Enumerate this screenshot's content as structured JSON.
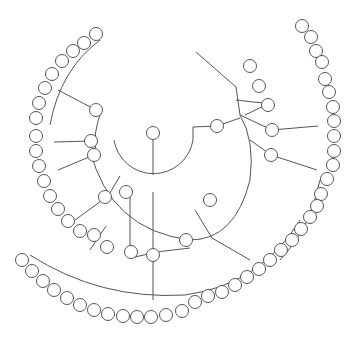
{
  "diagram": {
    "type": "radial-tree",
    "background": "#ffffff",
    "stroke_color": "#555555",
    "node_radius": 6.5,
    "root": {
      "x": 153,
      "y": 133
    },
    "arcs": [
      {
        "name": "inner-arc",
        "d": "M 114 140 A 40 40 0 0 0 193 140 L 193 127"
      },
      {
        "name": "mid-arc",
        "d": "M 102 110 A 80 80 0 0 0 96 155"
      },
      {
        "name": "main-arc",
        "d": "M 90 150 Q 110 230 190 240 Q 235 240 250 180 Q 255 140 240 115"
      },
      {
        "name": "lower-arc",
        "d": "M 130 258 Q 160 250 190 248"
      },
      {
        "name": "outer-bottom-arc",
        "d": "M 30 255 Q 100 300 185 295 Q 260 285 300 220"
      },
      {
        "name": "outer-topleft-arc",
        "d": "M 100 40 Q 60 70 50 125"
      },
      {
        "name": "outer-right-arc",
        "d": "M 320 180 Q 310 230 280 260"
      }
    ],
    "edges": [
      [
        153,
        133,
        153,
        175
      ],
      [
        193,
        127,
        217,
        126
      ],
      [
        240,
        118,
        217,
        126
      ],
      [
        240,
        115,
        272,
        130
      ],
      [
        240,
        115,
        236,
        87
      ],
      [
        236,
        87,
        212,
        66
      ],
      [
        212,
        66,
        196,
        52
      ],
      [
        236,
        100,
        253,
        102
      ],
      [
        253,
        102,
        265,
        103
      ],
      [
        245,
        115,
        270,
        103
      ],
      [
        250,
        140,
        271,
        155
      ],
      [
        271,
        155,
        317,
        170
      ],
      [
        272,
        130,
        318,
        126
      ],
      [
        195,
        210,
        212,
        238
      ],
      [
        212,
        238,
        250,
        260
      ],
      [
        153,
        192,
        153,
        300
      ],
      [
        130,
        190,
        130,
        258
      ],
      [
        96,
        110,
        58,
        90
      ],
      [
        91,
        141,
        54,
        142
      ],
      [
        94,
        155,
        58,
        170
      ],
      [
        108,
        196,
        75,
        220
      ],
      [
        108,
        196,
        120,
        176
      ],
      [
        106,
        226,
        90,
        250
      ]
    ],
    "nodes": [
      {
        "id": "root-leaf",
        "x": 153,
        "y": 133
      },
      {
        "id": "n-top-right-1",
        "x": 217,
        "y": 126
      },
      {
        "id": "n-right-a",
        "x": 250,
        "y": 66
      },
      {
        "id": "n-right-b",
        "x": 259,
        "y": 86
      },
      {
        "id": "n-right-c",
        "x": 268,
        "y": 105
      },
      {
        "id": "n-right-d",
        "x": 272,
        "y": 130
      },
      {
        "id": "n-right-e",
        "x": 271,
        "y": 155
      },
      {
        "id": "n-low-right",
        "x": 210,
        "y": 200
      },
      {
        "id": "n-low-mid",
        "x": 186,
        "y": 240
      },
      {
        "id": "n-low-left-a",
        "x": 131,
        "y": 252
      },
      {
        "id": "n-low-left-b",
        "x": 153,
        "y": 255
      },
      {
        "id": "n-left-hub",
        "x": 96,
        "y": 110
      },
      {
        "id": "n-left-mid-a",
        "x": 91,
        "y": 141
      },
      {
        "id": "n-left-mid-b",
        "x": 94,
        "y": 155
      },
      {
        "id": "n-left-low-a",
        "x": 105,
        "y": 197
      },
      {
        "id": "n-left-low-b",
        "x": 126,
        "y": 192
      },
      {
        "id": "leaf-tl-1",
        "x": 96,
        "y": 34
      },
      {
        "id": "leaf-tl-2",
        "x": 84,
        "y": 43
      },
      {
        "id": "leaf-tl-3",
        "x": 73,
        "y": 51
      },
      {
        "id": "leaf-tl-4",
        "x": 62,
        "y": 61
      },
      {
        "id": "leaf-tl-5",
        "x": 52,
        "y": 74
      },
      {
        "id": "leaf-tl-6",
        "x": 45,
        "y": 88
      },
      {
        "id": "leaf-tl-7",
        "x": 39,
        "y": 103
      },
      {
        "id": "leaf-tl-8",
        "x": 36,
        "y": 118
      },
      {
        "id": "leaf-l-1",
        "x": 36,
        "y": 136
      },
      {
        "id": "leaf-l-2",
        "x": 36,
        "y": 151
      },
      {
        "id": "leaf-l-3",
        "x": 39,
        "y": 166
      },
      {
        "id": "leaf-l-4",
        "x": 44,
        "y": 181
      },
      {
        "id": "leaf-l-5",
        "x": 50,
        "y": 196
      },
      {
        "id": "leaf-l-6",
        "x": 58,
        "y": 209
      },
      {
        "id": "leaf-l-7",
        "x": 68,
        "y": 221
      },
      {
        "id": "leaf-l-8",
        "x": 80,
        "y": 231
      },
      {
        "id": "leaf-l-9",
        "x": 94,
        "y": 235
      },
      {
        "id": "leaf-l-10",
        "x": 107,
        "y": 247
      },
      {
        "id": "leaf-tr-1",
        "x": 302,
        "y": 26
      },
      {
        "id": "leaf-tr-2",
        "x": 311,
        "y": 37
      },
      {
        "id": "leaf-tr-3",
        "x": 316,
        "y": 51
      },
      {
        "id": "leaf-tr-4",
        "x": 322,
        "y": 62
      },
      {
        "id": "leaf-tr-5",
        "x": 325,
        "y": 79
      },
      {
        "id": "leaf-tr-6",
        "x": 329,
        "y": 92
      },
      {
        "id": "leaf-tr-7",
        "x": 333,
        "y": 107
      },
      {
        "id": "leaf-tr-8",
        "x": 334,
        "y": 121
      },
      {
        "id": "leaf-tr-9",
        "x": 334,
        "y": 136
      },
      {
        "id": "leaf-tr-10",
        "x": 334,
        "y": 151
      },
      {
        "id": "leaf-tr-11",
        "x": 333,
        "y": 165
      },
      {
        "id": "leaf-r-1",
        "x": 327,
        "y": 179
      },
      {
        "id": "leaf-r-2",
        "x": 321,
        "y": 194
      },
      {
        "id": "leaf-r-3",
        "x": 317,
        "y": 206
      },
      {
        "id": "leaf-r-4",
        "x": 310,
        "y": 217
      },
      {
        "id": "leaf-r-5",
        "x": 301,
        "y": 229
      },
      {
        "id": "leaf-r-6",
        "x": 292,
        "y": 240
      },
      {
        "id": "leaf-r-7",
        "x": 281,
        "y": 250
      },
      {
        "id": "leaf-r-8",
        "x": 270,
        "y": 260
      },
      {
        "id": "leaf-r-9",
        "x": 259,
        "y": 269
      },
      {
        "id": "leaf-r-10",
        "x": 247,
        "y": 277
      },
      {
        "id": "leaf-r-11",
        "x": 235,
        "y": 285
      },
      {
        "id": "leaf-r-12",
        "x": 222,
        "y": 292
      },
      {
        "id": "leaf-r-13",
        "x": 208,
        "y": 296
      },
      {
        "id": "leaf-r-14",
        "x": 195,
        "y": 302
      },
      {
        "id": "leaf-r-15",
        "x": 182,
        "y": 311
      },
      {
        "id": "leaf-r-16",
        "x": 166,
        "y": 315
      },
      {
        "id": "leaf-b-1",
        "x": 151,
        "y": 317
      },
      {
        "id": "leaf-b-2",
        "x": 137,
        "y": 317
      },
      {
        "id": "leaf-b-3",
        "x": 123,
        "y": 316
      },
      {
        "id": "leaf-b-4",
        "x": 108,
        "y": 314
      },
      {
        "id": "leaf-b-5",
        "x": 94,
        "y": 310
      },
      {
        "id": "leaf-b-6",
        "x": 80,
        "y": 305
      },
      {
        "id": "leaf-b-7",
        "x": 67,
        "y": 298
      },
      {
        "id": "leaf-b-8",
        "x": 54,
        "y": 290
      },
      {
        "id": "leaf-b-9",
        "x": 43,
        "y": 281
      },
      {
        "id": "leaf-b-10",
        "x": 32,
        "y": 271
      },
      {
        "id": "leaf-b-11",
        "x": 22,
        "y": 260
      }
    ]
  }
}
